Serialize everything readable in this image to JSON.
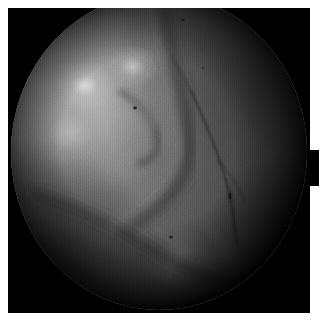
{
  "image": {
    "kind": "endoscopic-photograph",
    "modality_label": "Endoscopy",
    "subject": "mucosal tissue surface",
    "width_px": 323,
    "height_px": 325,
    "field_of_view_shape": "circle",
    "color_mode": "grayscale",
    "frame": {
      "border_color": "#ffffff",
      "border_width_px": 8,
      "background_color": "#000000"
    },
    "palette": {
      "background": "#000000",
      "border": "#ffffff",
      "tissue_mid": "#6d6d6d",
      "tissue_light": "#9a9a9a",
      "tissue_highlight": "#d7d7d7",
      "tissue_shadow": "#2c2c2c",
      "vessel": "#242424"
    },
    "features": [
      {
        "name": "upper-left-tissue-mass",
        "description": "Large rounded bulge of tissue filling the upper-left half of the field, brightest area of the image.",
        "center_pct": [
          28,
          34
        ],
        "brightness": "light"
      },
      {
        "name": "central-fold-ridge",
        "description": "Curved fold running from the top center down and to the left, separating the two tissue lobes.",
        "brightness": "mid"
      },
      {
        "name": "diagonal-fold-lower-left",
        "description": "Long diagonal crease sweeping from mid-left down toward the lower right.",
        "brightness": "shadow"
      },
      {
        "name": "right-lobe",
        "description": "Darker smooth tissue lobe occupying the right side of the field.",
        "center_pct": [
          78,
          45
        ],
        "brightness": "dark"
      },
      {
        "name": "vessel-main",
        "description": "Thin dark branching vessel descending through the right-of-center tissue.",
        "brightness": "vessel"
      },
      {
        "name": "specular-highlight-1",
        "description": "Bright specular light reflection on the upper-left bulge.",
        "center_pct": [
          25,
          29
        ]
      },
      {
        "name": "specular-highlight-2",
        "description": "Smaller bright reflection near the top of the central ridge.",
        "center_pct": [
          41,
          23
        ]
      },
      {
        "name": "debris-speck-1",
        "description": "Small dark particle on the upper tissue surface.",
        "center_pct": [
          42,
          36
        ]
      },
      {
        "name": "debris-speck-2",
        "description": "Small dark particle on the right lobe beside the vessel.",
        "center_pct": [
          74,
          64
        ]
      },
      {
        "name": "debris-speck-3",
        "description": "Small dark particle low in the field.",
        "center_pct": [
          54,
          77
        ]
      },
      {
        "name": "edge-notch",
        "description": "Black notch on the right border where the masked field extends past the frame.",
        "rect_px": [
          310,
          150,
          9,
          36
        ]
      }
    ],
    "overlay_text": []
  }
}
